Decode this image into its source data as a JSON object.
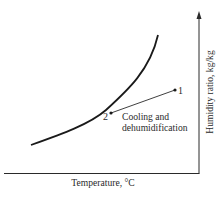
{
  "diagram": {
    "type": "psychrometric-process",
    "x_axis": {
      "label": "Temperature, °C"
    },
    "y_axis": {
      "label": "Humidity ratio, kg/kg"
    },
    "saturation_curve": {
      "description": "saturation line"
    },
    "points": [
      {
        "id": "1",
        "label": "1"
      },
      {
        "id": "2",
        "label": "2"
      }
    ],
    "process": {
      "from": "1",
      "to": "2",
      "label_line1": "Cooling and",
      "label_line2": "dehumidification"
    },
    "colors": {
      "ink": "#2a2a2a",
      "background": "#ffffff"
    }
  }
}
